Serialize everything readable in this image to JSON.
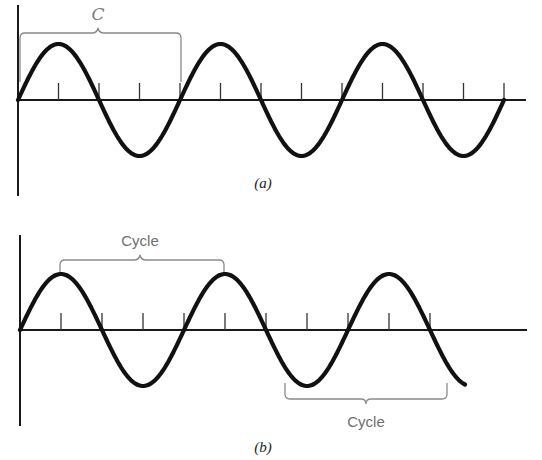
{
  "panels": [
    {
      "id": "a",
      "caption": "(a)",
      "bracket_label": "C",
      "bracket_label_style": "italic serif",
      "bracket_position": "above",
      "bracket_span": "zero crossing to zero crossing (one full cycle)",
      "cycles_shown": 3,
      "ticks_per_cycle": 4
    },
    {
      "id": "b",
      "caption": "(b)",
      "brackets": [
        {
          "label": "Cycle",
          "position": "above",
          "span": "peak to peak"
        },
        {
          "label": "Cycle",
          "position": "below",
          "span": "trough to trough"
        }
      ],
      "cycles_shown": 2.6,
      "ticks_per_cycle": 4
    }
  ],
  "colors": {
    "curve": "#111111",
    "axis": "#1a1a1a",
    "bracket": "#8a8a8a",
    "label": "#6f6f6f",
    "background": "#ffffff"
  }
}
